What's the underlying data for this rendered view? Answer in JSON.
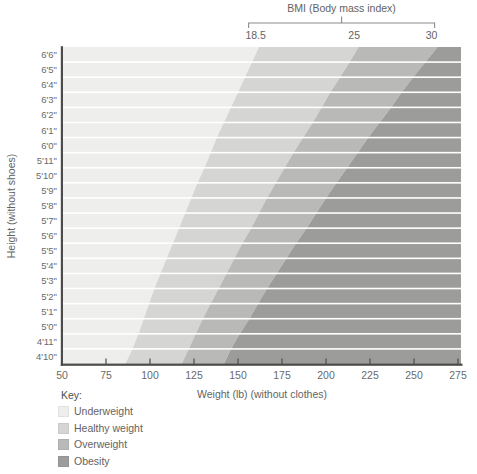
{
  "bmi_axis": {
    "title": "BMI (Body mass index)",
    "ticks": [
      "18.5",
      "25",
      "30"
    ]
  },
  "axes": {
    "y_title": "Height (without shoes)",
    "x_title": "Weight (lb) (without clothes)",
    "x_tick_labels": [
      "50",
      "75",
      "100",
      "125",
      "150",
      "175",
      "200",
      "225",
      "250",
      "275"
    ]
  },
  "key": {
    "label": "Key:",
    "items": [
      {
        "label": "Underweight",
        "color": "#eeeeec"
      },
      {
        "label": "Healthy weight",
        "color": "#d5d5d3"
      },
      {
        "label": "Overweight",
        "color": "#b9b9b7"
      },
      {
        "label": "Obesity",
        "color": "#9c9c9a"
      }
    ]
  },
  "chart_data": {
    "type": "area",
    "title": "BMI (Body mass index)",
    "xlabel": "Weight (lb) (without clothes)",
    "ylabel": "Height (without shoes)",
    "x_axis": {
      "min": 50,
      "max": 275,
      "ticks": [
        50,
        75,
        100,
        125,
        150,
        175,
        200,
        225,
        250,
        275
      ],
      "unit": "lb"
    },
    "bmi_thresholds": [
      18.5,
      25,
      30
    ],
    "categories": [
      "Underweight",
      "Healthy weight",
      "Overweight",
      "Obesity"
    ],
    "colors": [
      "#eeeeec",
      "#d5d5d3",
      "#b9b9b7",
      "#9c9c9a"
    ],
    "separator_color": "#ffffff",
    "axis_color": "#4c4c4c",
    "bracket_color": "#8c8c8c",
    "formula": "weight_lb = bmi * height_in^2 / 703",
    "rows": [
      {
        "label": "6'6\"",
        "height_in": 78,
        "bmi_boundary_weights_lb": [
          160,
          216,
          260
        ]
      },
      {
        "label": "6'5\"",
        "height_in": 77,
        "bmi_boundary_weights_lb": [
          156,
          211,
          253
        ]
      },
      {
        "label": "6'4\"",
        "height_in": 76,
        "bmi_boundary_weights_lb": [
          152,
          205,
          246
        ]
      },
      {
        "label": "6'3\"",
        "height_in": 75,
        "bmi_boundary_weights_lb": [
          148,
          200,
          240
        ]
      },
      {
        "label": "6'2\"",
        "height_in": 74,
        "bmi_boundary_weights_lb": [
          144,
          195,
          234
        ]
      },
      {
        "label": "6'1\"",
        "height_in": 73,
        "bmi_boundary_weights_lb": [
          140,
          190,
          227
        ]
      },
      {
        "label": "6'0\"",
        "height_in": 72,
        "bmi_boundary_weights_lb": [
          136,
          184,
          221
        ]
      },
      {
        "label": "5'11\"",
        "height_in": 71,
        "bmi_boundary_weights_lb": [
          133,
          179,
          215
        ]
      },
      {
        "label": "5'10\"",
        "height_in": 70,
        "bmi_boundary_weights_lb": [
          129,
          174,
          209
        ]
      },
      {
        "label": "5'9\"",
        "height_in": 69,
        "bmi_boundary_weights_lb": [
          125,
          169,
          203
        ]
      },
      {
        "label": "5'8\"",
        "height_in": 68,
        "bmi_boundary_weights_lb": [
          122,
          164,
          197
        ]
      },
      {
        "label": "5'7\"",
        "height_in": 67,
        "bmi_boundary_weights_lb": [
          118,
          160,
          192
        ]
      },
      {
        "label": "5'6\"",
        "height_in": 66,
        "bmi_boundary_weights_lb": [
          115,
          155,
          186
        ]
      },
      {
        "label": "5'5\"",
        "height_in": 65,
        "bmi_boundary_weights_lb": [
          111,
          150,
          180
        ]
      },
      {
        "label": "5'4\"",
        "height_in": 64,
        "bmi_boundary_weights_lb": [
          108,
          146,
          175
        ]
      },
      {
        "label": "5'3\"",
        "height_in": 63,
        "bmi_boundary_weights_lb": [
          104,
          141,
          169
        ]
      },
      {
        "label": "5'2\"",
        "height_in": 62,
        "bmi_boundary_weights_lb": [
          101,
          137,
          164
        ]
      },
      {
        "label": "5'1\"",
        "height_in": 61,
        "bmi_boundary_weights_lb": [
          98,
          132,
          159
        ]
      },
      {
        "label": "5'0\"",
        "height_in": 60,
        "bmi_boundary_weights_lb": [
          95,
          128,
          154
        ]
      },
      {
        "label": "4'11\"",
        "height_in": 59,
        "bmi_boundary_weights_lb": [
          92,
          124,
          148
        ]
      },
      {
        "label": "4'10\"",
        "height_in": 58,
        "bmi_boundary_weights_lb": [
          88,
          120,
          144
        ]
      }
    ]
  }
}
